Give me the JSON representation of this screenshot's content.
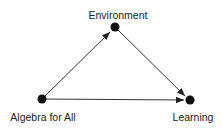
{
  "diagram": {
    "nodes": [
      {
        "id": "environment",
        "label": "Environment"
      },
      {
        "id": "algebra",
        "label": "Algebra for All"
      },
      {
        "id": "learning",
        "label": "Learning"
      }
    ],
    "edges": [
      {
        "from": "algebra",
        "to": "environment"
      },
      {
        "from": "environment",
        "to": "learning"
      },
      {
        "from": "algebra",
        "to": "learning"
      }
    ],
    "colors": {
      "node": "#111111",
      "edge": "#333333",
      "text": "#222222"
    }
  }
}
